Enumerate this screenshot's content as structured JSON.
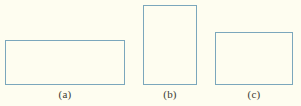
{
  "figure": {
    "background_color": "#fefdf0",
    "stroke_color": "#7ba7bc",
    "label_color": "#3b3b33",
    "shapes": [
      {
        "id": "a",
        "shape": "rectangle",
        "caption": "(a)",
        "x": 5,
        "y": 40,
        "width": 120,
        "height": 45
      },
      {
        "id": "b",
        "shape": "rectangle",
        "caption": "(b)",
        "x": 143,
        "y": 5,
        "width": 54,
        "height": 80
      },
      {
        "id": "c",
        "shape": "rectangle",
        "caption": "(c)",
        "x": 215,
        "y": 32,
        "width": 78,
        "height": 53
      }
    ]
  }
}
